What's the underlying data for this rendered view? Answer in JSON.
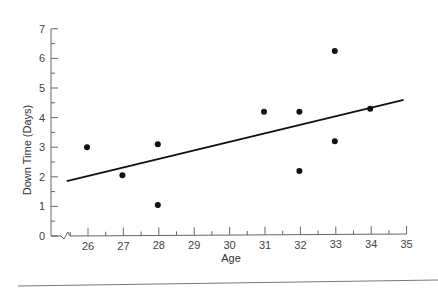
{
  "chart_data": {
    "type": "scatter",
    "title": "",
    "xlabel": "Age",
    "ylabel": "Down Time (Days)",
    "xlim": [
      25,
      35
    ],
    "ylim": [
      0,
      7
    ],
    "x_ticks": [
      26,
      27,
      28,
      29,
      30,
      31,
      32,
      33,
      34,
      35
    ],
    "y_ticks": [
      0,
      1,
      2,
      3,
      4,
      5,
      6,
      7
    ],
    "x_axis_break": true,
    "grid": false,
    "legend": null,
    "series": [
      {
        "name": "observations",
        "type": "scatter",
        "points": [
          {
            "x": 26,
            "y": 3.0
          },
          {
            "x": 27,
            "y": 2.05
          },
          {
            "x": 28,
            "y": 3.1
          },
          {
            "x": 28,
            "y": 1.05
          },
          {
            "x": 31,
            "y": 4.2
          },
          {
            "x": 32,
            "y": 4.2
          },
          {
            "x": 32,
            "y": 2.2
          },
          {
            "x": 33,
            "y": 6.25
          },
          {
            "x": 33,
            "y": 3.2
          },
          {
            "x": 34,
            "y": 4.3
          }
        ]
      },
      {
        "name": "regression line",
        "type": "line",
        "points": [
          {
            "x": 25.4,
            "y": 1.85
          },
          {
            "x": 35.0,
            "y": 4.7
          }
        ]
      }
    ]
  }
}
